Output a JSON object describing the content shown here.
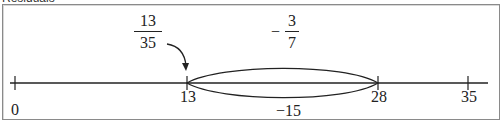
{
  "header": {
    "cut_off_text": "Residuals"
  },
  "diagram": {
    "number_line": {
      "ticks": [
        {
          "value": "0",
          "x": 15
        },
        {
          "value": "13",
          "x": 187
        },
        {
          "value": "28",
          "x": 378
        },
        {
          "value": "35",
          "x": 468
        }
      ]
    },
    "interval_label": "−15",
    "fraction_left": {
      "numerator": "13",
      "denominator": "35"
    },
    "fraction_right": {
      "sign": "−",
      "numerator": "3",
      "denominator": "7"
    }
  },
  "colors": {
    "line": "#222222",
    "frame": "#8a8a8a"
  }
}
